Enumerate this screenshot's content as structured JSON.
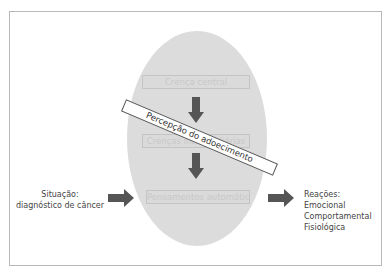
{
  "diagram": {
    "boxes": [
      {
        "label": "Crença central"
      },
      {
        "label": "Crenças intermediárias"
      },
      {
        "label": "Pensamentos automáticos"
      }
    ],
    "banner": {
      "label": "Percepção do adoecimento"
    },
    "situation": {
      "title": "Situação:",
      "detail": "diagnóstico de câncer"
    },
    "reactions": {
      "title": "Reações:",
      "items": [
        "Emocional",
        "Comportamental",
        "Fisiológica"
      ]
    },
    "colors": {
      "ellipse": "#dcdcdc",
      "arrow": "#555555",
      "frame": "#b8b8b8"
    }
  }
}
